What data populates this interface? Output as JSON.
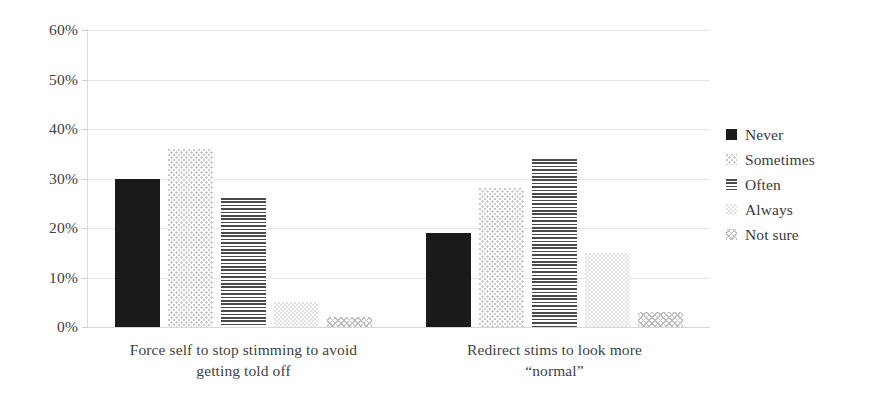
{
  "chart_data": {
    "type": "bar",
    "title": "",
    "xlabel": "",
    "ylabel": "",
    "ylim": [
      0,
      60
    ],
    "y_tick_labels": [
      "60%",
      "50%",
      "40%",
      "30%",
      "20%",
      "10%",
      "0%"
    ],
    "y_tick_values": [
      60,
      50,
      40,
      30,
      20,
      10,
      0
    ],
    "grid": true,
    "legend_position": "right",
    "value_suffix": "%",
    "categories": [
      "Force self to stop stimming to avoid getting told off",
      "Redirect stims to look more “normal”"
    ],
    "category_lines": [
      [
        "Force self to stop stimming to avoid",
        "getting told off"
      ],
      [
        "Redirect stims to look more",
        "“normal”"
      ]
    ],
    "series": [
      {
        "name": "Never",
        "pattern": "solid-black",
        "values": [
          30,
          19
        ]
      },
      {
        "name": "Sometimes",
        "pattern": "light-dots",
        "values": [
          36,
          28
        ]
      },
      {
        "name": "Often",
        "pattern": "horizontal-lines",
        "values": [
          26,
          34
        ]
      },
      {
        "name": "Always",
        "pattern": "faint-dots",
        "values": [
          5,
          15
        ]
      },
      {
        "name": "Not sure",
        "pattern": "cross-hatch",
        "values": [
          2,
          3
        ]
      }
    ]
  },
  "legend": {
    "items": [
      {
        "label": "Never"
      },
      {
        "label": "Sometimes"
      },
      {
        "label": "Often"
      },
      {
        "label": "Always"
      },
      {
        "label": "Not sure"
      }
    ]
  },
  "colors": {
    "series_never": "#1a1a1a",
    "series_sometimes": "#c9c9c9",
    "series_often": "#4a4a4a",
    "series_always": "#e2e2e2",
    "series_not_sure": "#bdbdbd",
    "gridline": "#e6e6e6",
    "text": "#3a3a3a"
  }
}
